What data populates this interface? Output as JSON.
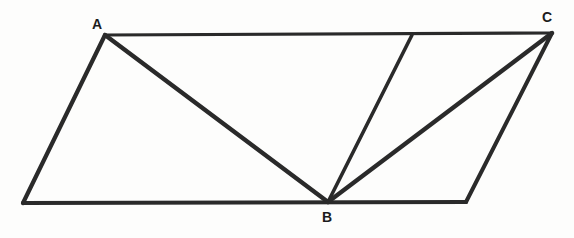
{
  "figure": {
    "background_color": "#fdfdfc",
    "stroke_color": "#2a2a2a",
    "canvas": {
      "width": 574,
      "height": 238
    },
    "vertices": {
      "A": {
        "label": "A",
        "x": 105,
        "y": 35
      },
      "B": {
        "label": "B",
        "x": 328,
        "y": 202
      },
      "C": {
        "label": "C",
        "x": 552,
        "y": 33
      },
      "bottom_left": {
        "label": "",
        "x": 23,
        "y": 203
      },
      "bottom_right": {
        "label": "",
        "x": 466,
        "y": 202
      },
      "top_junction": {
        "label": "",
        "x": 412,
        "y": 35
      }
    },
    "labels": [
      {
        "text": "A",
        "x": 97,
        "y": 24,
        "name": "vertex-label-a"
      },
      {
        "text": "B",
        "x": 327,
        "y": 217,
        "name": "vertex-label-b"
      },
      {
        "text": "C",
        "x": 547,
        "y": 17,
        "name": "vertex-label-c"
      }
    ],
    "segments": [
      {
        "name": "top-edge-a-to-c",
        "x1": 105,
        "y1": 35,
        "x2": 552,
        "y2": 33,
        "width": 3.2
      },
      {
        "name": "left-edge-a-to-bottom-left",
        "x1": 105,
        "y1": 35,
        "x2": 23,
        "y2": 203,
        "width": 4.2
      },
      {
        "name": "bottom-edge-bottom-left-to-bottom-right",
        "x1": 23,
        "y1": 203,
        "x2": 466,
        "y2": 202,
        "width": 4.2
      },
      {
        "name": "right-edge-bottom-right-to-c",
        "x1": 466,
        "y1": 202,
        "x2": 552,
        "y2": 33,
        "width": 4.0
      },
      {
        "name": "diagonal-a-to-b",
        "x1": 105,
        "y1": 35,
        "x2": 328,
        "y2": 202,
        "width": 4.4
      },
      {
        "name": "cevian-b-to-top-junction",
        "x1": 328,
        "y1": 202,
        "x2": 412,
        "y2": 35,
        "width": 3.6
      },
      {
        "name": "diagonal-b-to-c",
        "x1": 328,
        "y1": 202,
        "x2": 552,
        "y2": 33,
        "width": 4.4
      }
    ]
  }
}
